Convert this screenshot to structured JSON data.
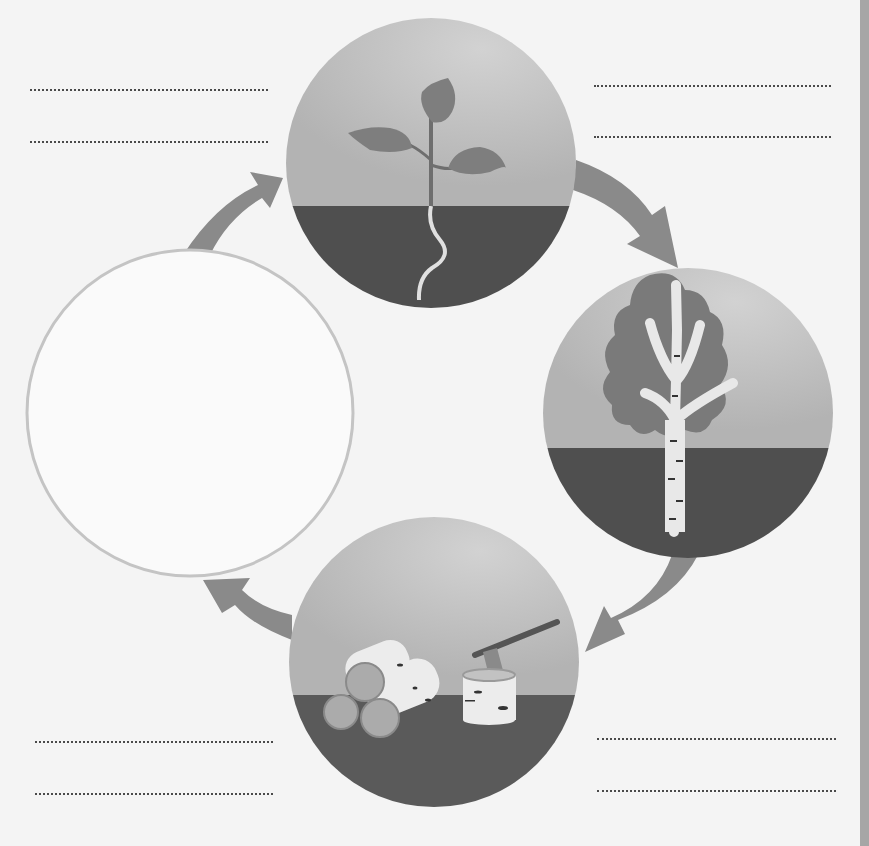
{
  "diagram": {
    "type": "cycle",
    "colors": {
      "page_background": "#f4f4f4",
      "sky": "#b9b9b9",
      "ground": "#4f4f4f",
      "arrow": "#8a8a8a",
      "leaf": "#7e7e7e",
      "bark": "#e8e8e8",
      "empty_circle_stroke": "#c4c4c4",
      "dotted_line": "#4a4a4a",
      "edge_bar": "#a6a6a6"
    },
    "stages": [
      {
        "id": "seedling",
        "icon": "seedling-icon",
        "label": ""
      },
      {
        "id": "tree",
        "icon": "birch-tree-icon",
        "label": ""
      },
      {
        "id": "logs",
        "icon": "logs-and-axe-icon",
        "label": ""
      },
      {
        "id": "blank",
        "icon": "empty-circle",
        "label": ""
      }
    ],
    "arrows": [
      {
        "from": "blank",
        "to": "seedling"
      },
      {
        "from": "seedling",
        "to": "tree"
      },
      {
        "from": "tree",
        "to": "logs"
      },
      {
        "from": "logs",
        "to": "blank"
      }
    ],
    "answer_lines": {
      "top_left": [
        "",
        ""
      ],
      "top_right": [
        "",
        ""
      ],
      "bottom_left": [
        "",
        ""
      ],
      "bottom_right": [
        "",
        ""
      ]
    }
  }
}
